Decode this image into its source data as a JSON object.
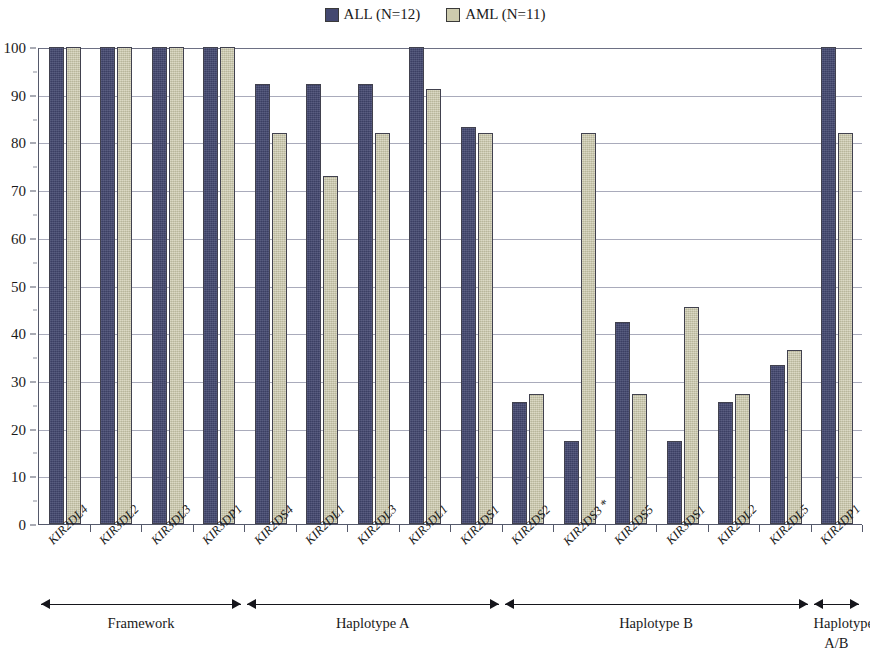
{
  "legend": {
    "items": [
      {
        "label": "ALL (N=12)",
        "color": "#434870",
        "icon": "square-swatch"
      },
      {
        "label": "AML (N=11)",
        "color": "#cdcbae",
        "icon": "square-swatch"
      }
    ]
  },
  "yaxis": {
    "ticks": [
      "100",
      "90",
      "80",
      "70",
      "60",
      "50",
      "40",
      "30",
      "20",
      "10",
      "0"
    ],
    "min": 0,
    "max": 100,
    "step": 10
  },
  "groups": [
    {
      "label": "Framework",
      "text_line2": "",
      "start": 0,
      "end": 3
    },
    {
      "label": "Haplotype A",
      "text_line2": "",
      "start": 4,
      "end": 8
    },
    {
      "label": "Haplotype B",
      "text_line2": "",
      "start": 9,
      "end": 14
    },
    {
      "label": "Haplotype",
      "text_line2": "A/B",
      "start": 15,
      "end": 15
    }
  ],
  "chart_data": {
    "type": "bar",
    "title": "",
    "xlabel": "",
    "ylabel": "",
    "ylim": [
      0,
      100
    ],
    "grid": true,
    "legend_position": "top-center",
    "categories": [
      "KIR2DL4",
      "KIR3DL2",
      "KIR3DL3",
      "KIR3DP1",
      "KIR2DS4",
      "KIR2DL1",
      "KIR2DL3",
      "KIR3DL1",
      "KIR2DS1",
      "KIR2DS2",
      "KIR2DS3 *",
      "KIR2DS5",
      "KIR3DS1",
      "KIR2DL2",
      "KIR2DL5",
      "KIR2DP1"
    ],
    "series": [
      {
        "name": "ALL (N=12)",
        "color": "#434870",
        "values": [
          100,
          100,
          100,
          100,
          92.3,
          92.3,
          92.3,
          100,
          83.3,
          25.5,
          17.5,
          42.3,
          17.5,
          25.5,
          33.4,
          100
        ]
      },
      {
        "name": "AML (N=11)",
        "color": "#cdcbae",
        "values": [
          100,
          100,
          100,
          100,
          82,
          73,
          82,
          91.2,
          82,
          27.2,
          82,
          27.2,
          45.4,
          27.2,
          36.4,
          82
        ]
      }
    ],
    "annotations": [
      {
        "text": "*",
        "attached_to": "KIR2DS3"
      }
    ]
  }
}
